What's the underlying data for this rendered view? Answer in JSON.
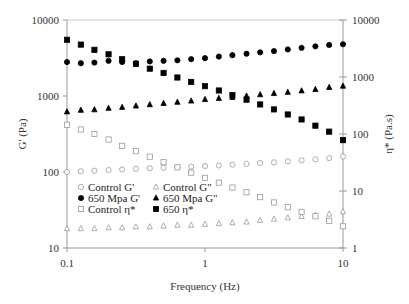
{
  "chart_data": {
    "type": "scatter",
    "title": "",
    "xlabel": "Frequency (Hz)",
    "ylabel": "G' (Pa)",
    "y2label": "η* (Pa.s)",
    "xscale": "log",
    "yscale": "log",
    "y2scale": "log",
    "xlim": [
      0.1,
      10
    ],
    "ylim": [
      10,
      10000
    ],
    "y2lim": [
      1,
      10000
    ],
    "x_ticks": [
      "0.1",
      "1",
      "10"
    ],
    "y_ticks": [
      "10",
      "100",
      "1000",
      "10000"
    ],
    "y2_ticks": [
      "1",
      "10",
      "100",
      "1000",
      "10000"
    ],
    "grid": false,
    "legend_position": "inside-lower-left",
    "x": [
      0.1,
      0.126,
      0.158,
      0.2,
      0.251,
      0.316,
      0.398,
      0.501,
      0.631,
      0.794,
      1.0,
      1.26,
      1.58,
      2.0,
      2.51,
      3.16,
      3.98,
      5.01,
      6.31,
      7.94,
      10.0
    ],
    "series": [
      {
        "name": "Control G'",
        "marker": "open-circle",
        "axis": "left",
        "values": [
          100,
          102,
          104,
          106,
          108,
          110,
          112,
          114,
          116,
          118,
          120,
          122,
          125,
          128,
          131,
          134,
          138,
          142,
          147,
          152,
          160
        ]
      },
      {
        "name": "Control G\"",
        "marker": "open-triangle",
        "axis": "left",
        "values": [
          18,
          18,
          18,
          18.5,
          18.5,
          19,
          19,
          19.5,
          20,
          20,
          20.5,
          21,
          21.5,
          22,
          23,
          24,
          25,
          26,
          27,
          28,
          30
        ]
      },
      {
        "name": "650 Mpa G'",
        "marker": "filled-circle",
        "axis": "left",
        "values": [
          2800,
          2700,
          2750,
          2900,
          2800,
          2700,
          2850,
          2900,
          2950,
          3050,
          3150,
          3300,
          3450,
          3600,
          3750,
          3900,
          4100,
          4300,
          4500,
          4700,
          4800
        ]
      },
      {
        "name": "650 Mpa G\"",
        "marker": "filled-triangle",
        "axis": "left",
        "values": [
          620,
          650,
          660,
          690,
          710,
          740,
          770,
          800,
          830,
          860,
          900,
          930,
          960,
          1000,
          1040,
          1080,
          1120,
          1170,
          1220,
          1300,
          1350
        ]
      },
      {
        "name": "Control η*",
        "marker": "open-square",
        "axis": "right",
        "values": [
          145,
          120,
          100,
          80,
          62,
          50,
          40,
          32,
          26,
          21,
          17,
          14,
          11.5,
          9.5,
          7.8,
          6.3,
          5.2,
          4.3,
          3.6,
          3.0,
          2.4
        ]
      },
      {
        "name": "650 η*",
        "marker": "filled-square",
        "axis": "right",
        "values": [
          4500,
          3700,
          3000,
          2500,
          2050,
          1700,
          1400,
          1180,
          980,
          820,
          690,
          580,
          480,
          400,
          330,
          270,
          220,
          180,
          140,
          110,
          78
        ]
      }
    ]
  },
  "legend": {
    "col1": [
      "Control G'",
      "650 Mpa G'",
      "Control η*"
    ],
    "col2": [
      "Control G\"",
      "650 Mpa G\"",
      "650 η*"
    ]
  }
}
